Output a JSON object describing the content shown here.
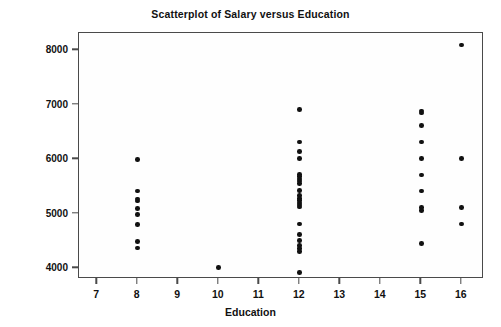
{
  "chart_data": {
    "type": "scatter",
    "title": "Scatterplot of Salary versus Education",
    "xlabel": "Education",
    "ylabel": "Salary",
    "xlim": [
      6.55,
      16.55
    ],
    "ylim": [
      3800,
      8320
    ],
    "grid": false,
    "legend": null,
    "xticks": [
      7,
      8,
      9,
      10,
      11,
      12,
      13,
      14,
      15,
      16
    ],
    "xticklabels": [
      "7",
      "8",
      "9",
      "10",
      "11",
      "12",
      "13",
      "14",
      "15",
      "16"
    ],
    "yticks": [
      4000,
      5000,
      6000,
      7000,
      8000
    ],
    "yticklabels": [
      "4000",
      "5000",
      "6000",
      "7000",
      "8000"
    ],
    "marker": "filled-circle",
    "marker_color": "#111111",
    "points": [
      {
        "x": 8,
        "y": 6000
      },
      {
        "x": 8,
        "y": 5420
      },
      {
        "x": 8,
        "y": 5270
      },
      {
        "x": 8,
        "y": 5230
      },
      {
        "x": 8,
        "y": 5100
      },
      {
        "x": 8,
        "y": 4980
      },
      {
        "x": 8,
        "y": 4800
      },
      {
        "x": 8,
        "y": 4490
      },
      {
        "x": 8,
        "y": 4370
      },
      {
        "x": 10,
        "y": 4010
      },
      {
        "x": 12,
        "y": 6910
      },
      {
        "x": 12,
        "y": 6320
      },
      {
        "x": 12,
        "y": 6140
      },
      {
        "x": 12,
        "y": 6010
      },
      {
        "x": 12,
        "y": 5720
      },
      {
        "x": 12,
        "y": 5680
      },
      {
        "x": 12,
        "y": 5640
      },
      {
        "x": 12,
        "y": 5600
      },
      {
        "x": 12,
        "y": 5560
      },
      {
        "x": 12,
        "y": 5430
      },
      {
        "x": 12,
        "y": 5330
      },
      {
        "x": 12,
        "y": 5280
      },
      {
        "x": 12,
        "y": 5240
      },
      {
        "x": 12,
        "y": 5200
      },
      {
        "x": 12,
        "y": 5160
      },
      {
        "x": 12,
        "y": 5120
      },
      {
        "x": 12,
        "y": 4810
      },
      {
        "x": 12,
        "y": 4620
      },
      {
        "x": 12,
        "y": 4510
      },
      {
        "x": 12,
        "y": 4420
      },
      {
        "x": 12,
        "y": 4360
      },
      {
        "x": 12,
        "y": 4300
      },
      {
        "x": 12,
        "y": 3920
      },
      {
        "x": 15,
        "y": 6890
      },
      {
        "x": 15,
        "y": 6850
      },
      {
        "x": 15,
        "y": 6620
      },
      {
        "x": 15,
        "y": 6320
      },
      {
        "x": 15,
        "y": 6010
      },
      {
        "x": 15,
        "y": 5710
      },
      {
        "x": 15,
        "y": 5420
      },
      {
        "x": 15,
        "y": 5110
      },
      {
        "x": 15,
        "y": 5060
      },
      {
        "x": 15,
        "y": 4450
      },
      {
        "x": 16,
        "y": 8100
      },
      {
        "x": 16,
        "y": 6010
      },
      {
        "x": 16,
        "y": 5110
      },
      {
        "x": 16,
        "y": 4810
      }
    ]
  }
}
